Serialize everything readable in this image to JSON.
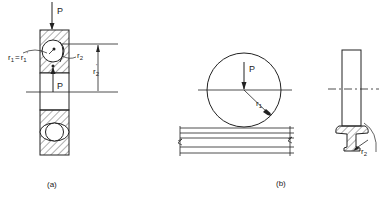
{
  "figure_a": {
    "caption": "(a)",
    "load_label_top": "P",
    "load_label_bottom": "P",
    "radius_label_left": "r1 = r1'",
    "radius_label_left_main": "r",
    "radius_label_left_sub": "1",
    "radius_label_left_eq": "=",
    "radius_label_left_prime": "r",
    "radius_label_left_prime_sub": "1",
    "radius_label_left_prime_mark": "'",
    "radius_label_right": "r2",
    "radius_label_right_main": "r",
    "radius_label_right_sub": "2",
    "dimension_label": "r2'",
    "dimension_label_main": "r",
    "dimension_label_sub": "2",
    "dimension_label_prime": "'"
  },
  "figure_b": {
    "caption": "(b)",
    "load_label": "P",
    "radius_label_main": "r",
    "radius_label_sub": "1",
    "flange_radius_main": "r",
    "flange_radius_sub": "2"
  },
  "colors": {
    "ink": "#222222",
    "background": "#ffffff"
  }
}
